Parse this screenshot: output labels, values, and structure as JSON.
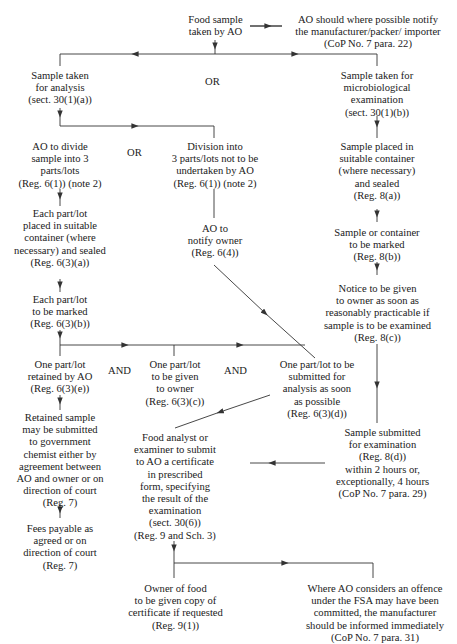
{
  "nodes": {
    "start": "Food sample\ntaken by AO",
    "notify_manufacturer": "AO should where possible notify\nthe manufacturer/packer/ importer\n(CoP No. 7 para. 22)",
    "analysis": "Sample taken\nfor analysis\n(sect. 30(1)(a))",
    "micro": "Sample taken for\nmicrobiological\nexamination\n(sect. 30(1)(b))",
    "divide": "AO to divide\nsample into 3\nparts/lots\n(Reg. 6(1)) (note 2)",
    "no_divide": "Division into\n3 parts/lots not to be\nundertaken by AO\n(Reg. 6(1)) (note 2)",
    "micro_container": "Sample placed in\nsuitable container\n(where necessary)\nand sealed\n(Reg. 8(a))",
    "each_placed": "Each part/lot\nplaced in suitable\ncontainer (where\nnecessary) and sealed\n(Reg. 6(3)(a))",
    "notify_owner": "AO to\nnotify owner\n(Reg. 6(4))",
    "micro_marked": "Sample or container\nto be marked\n(Reg. 8(b))",
    "each_marked": "Each part/lot\nto be marked\n(Reg. 6(3)(b))",
    "micro_notice": "Notice to be given\nto owner as soon as\nreasonably practicable if\nsample is to be examined\n(Reg. 8(c))",
    "retained": "One part/lot\nretained by AO\n(Reg. 6(3)(e))",
    "given_owner": "One part/lot\nto be given\nto owner\n(Reg. 6(3)(c))",
    "submitted_analysis": "One part/lot to be\nsubmitted for\nanalysis as soon\nas possible\n(Reg. 6(3)(d))",
    "retained_submit": "Retained sample\nmay be submitted\nto government\nchemist either by\nagreement between\nAO and owner or on\ndirection of court\n(Reg. 7)",
    "certificate": "Food analyst or\nexaminer to submit\nto AO a certificate\nin prescribed\nform, specifying\nthe result of the\nexamination\n(sect. 30(6))\n(Reg. 9 and Sch. 3)",
    "micro_submitted": "Sample submitted\nfor examination\n(Reg. 8(d))\nwithin 2 hours or,\nexceptionally, 4 hours\n(CoP No. 7 para. 29)",
    "fees": "Fees payable as\nagreed or on\ndirection of court\n(Reg. 7)",
    "owner_copy": "Owner of food\nto be given copy of\ncertificate if requested\n(Reg. 9(1))",
    "offence": "Where AO considers an offence\nunder the FSA may have been\ncommitted, the manufacturer\nshould be informed immediately\n(CoP No. 7 para. 31)"
  },
  "connectors": {
    "or_top": "OR",
    "or_divide": "OR",
    "and_1": "AND",
    "and_2": "AND"
  },
  "colors": {
    "line": "#333333",
    "text": "#1a1a1a",
    "background": "#ffffff"
  }
}
